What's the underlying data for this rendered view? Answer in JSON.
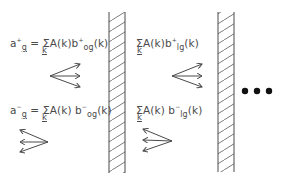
{
  "colors": {
    "ink": "#4a4a4a",
    "background": "#ffffff"
  },
  "equations": {
    "top_left": {
      "lhs": "a",
      "lhs_sup": "+",
      "lhs_sub": "g",
      "equals": "=",
      "sum_symbol": "Σ",
      "sum_index": "k",
      "term": "A(k)b",
      "term_sup": "+",
      "term_sub": "og",
      "arg": "(k)"
    },
    "bottom_left": {
      "lhs": "a",
      "lhs_sup": "−",
      "lhs_sub": "g",
      "equals": "=",
      "sum_symbol": "Σ",
      "sum_index": "k",
      "term": "A(k) b",
      "term_sup": "−",
      "term_sub": "og",
      "arg": "(k)"
    },
    "top_right": {
      "sum_symbol": "Σ",
      "sum_index": "k",
      "term": "A(k)b",
      "term_sup": "+",
      "term_sub": "lg",
      "arg": "(k)"
    },
    "bottom_right": {
      "sum_symbol": "Σ",
      "sum_index": "k",
      "term": "A(k) b",
      "term_sup": "−",
      "term_sub": "lg",
      "arg": "(k)"
    }
  },
  "ellipsis": "•••",
  "walls": [
    {
      "name": "wall-1",
      "x": 109,
      "width": 16,
      "top": 12,
      "bottom": 173
    },
    {
      "name": "wall-2",
      "x": 218,
      "width": 16,
      "top": 12,
      "bottom": 172
    }
  ],
  "arrow_fans": [
    {
      "name": "forward-waves-left",
      "direction": "right",
      "origin": [
        50,
        76
      ],
      "tips": [
        [
          80,
          64
        ],
        [
          80,
          76
        ],
        [
          80,
          87
        ]
      ]
    },
    {
      "name": "backward-waves-left",
      "direction": "left",
      "origin": [
        48,
        142
      ],
      "tips": [
        [
          20,
          130
        ],
        [
          20,
          142
        ],
        [
          20,
          152
        ]
      ]
    },
    {
      "name": "forward-waves-right",
      "direction": "right",
      "origin": [
        172,
        76
      ],
      "tips": [
        [
          202,
          64
        ],
        [
          202,
          76
        ],
        [
          202,
          87
        ]
      ]
    },
    {
      "name": "backward-waves-right",
      "direction": "left",
      "origin": [
        172,
        141
      ],
      "tips": [
        [
          143,
          129
        ],
        [
          143,
          140
        ],
        [
          143,
          151
        ]
      ]
    }
  ]
}
